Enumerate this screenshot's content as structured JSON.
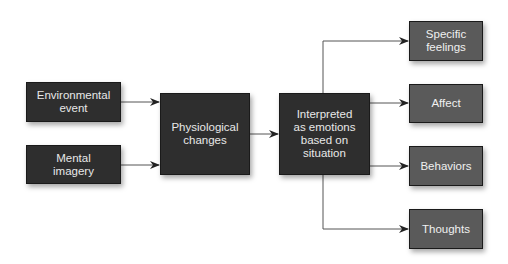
{
  "nodes": {
    "environmental_event": "Environmental\nevent",
    "mental_imagery": "Mental\nimagery",
    "physiological_changes": "Physiological\nchanges",
    "interpreted": "Interpreted\nas emotions\nbased on\nsituation",
    "specific_feelings": "Specific\nfeelings",
    "affect": "Affect",
    "behaviors": "Behaviors",
    "thoughts": "Thoughts"
  },
  "colors": {
    "source_box": "#2e2e2e",
    "outcome_box": "#5a5a5a",
    "text": "#e8e8e8",
    "connector": "#444444"
  }
}
